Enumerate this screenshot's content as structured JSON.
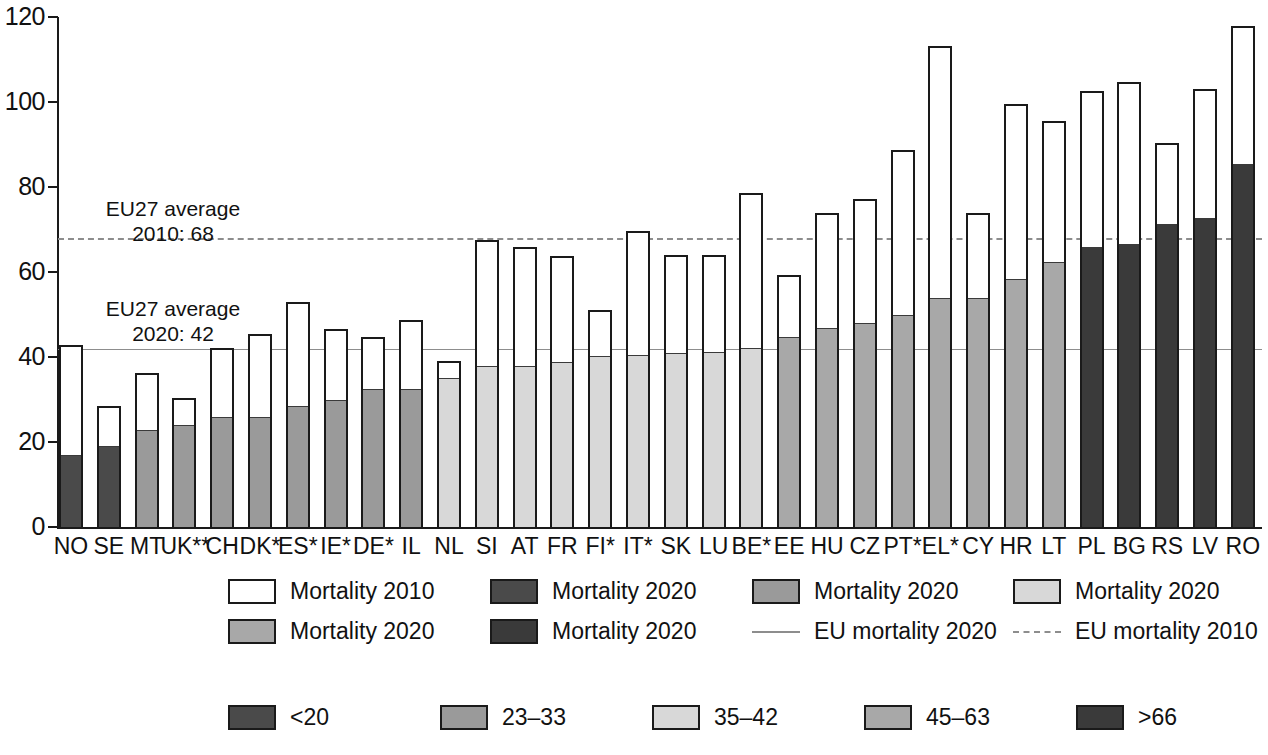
{
  "chart_data": {
    "type": "bar",
    "title": "",
    "subtitle": "",
    "xlabel": "",
    "ylabel": "",
    "ylim": [
      0,
      120
    ],
    "yticks": [
      0,
      20,
      40,
      60,
      80,
      100,
      120
    ],
    "grid": false,
    "legend_position": "bottom",
    "categories": [
      "NO",
      "SE",
      "MT",
      "UK**",
      "CH",
      "DK*",
      "ES*",
      "IE*",
      "DE*",
      "IL",
      "NL",
      "SI",
      "AT",
      "FR",
      "FI*",
      "IT*",
      "SK",
      "LU",
      "BE*",
      "EE",
      "HU",
      "CZ",
      "PT*",
      "EL*",
      "CY",
      "HR",
      "LT",
      "PL",
      "BG",
      "RS",
      "LV",
      "RO"
    ],
    "series": [
      {
        "name": "Mortality 2010",
        "values": [
          42.8,
          28.4,
          36.2,
          30.4,
          42.1,
          45.5,
          52.9,
          46.5,
          44.6,
          48.6,
          39.0,
          67.5,
          66.0,
          63.7,
          51.0,
          69.6,
          64.0,
          63.9,
          78.6,
          59.4,
          74.0,
          77.1,
          88.6,
          113.2,
          74.0,
          99.6,
          95.5,
          102.6,
          104.6,
          90.4,
          103.0,
          118.0
        ]
      },
      {
        "name": "Mortality 2020",
        "values": [
          17.0,
          19.1,
          22.8,
          24.1,
          25.9,
          26.0,
          28.4,
          30.0,
          32.5,
          32.4,
          35.0,
          37.8,
          38.0,
          38.9,
          40.2,
          40.4,
          41.0,
          41.1,
          42.2,
          44.8,
          46.9,
          47.9,
          49.9,
          53.9,
          53.9,
          58.4,
          62.3,
          65.8,
          66.6,
          71.2,
          72.8,
          85.4
        ]
      }
    ],
    "bands": [
      "<20",
      "23-33",
      "35-42",
      "45-63",
      ">66"
    ],
    "band_index": [
      0,
      0,
      1,
      1,
      1,
      1,
      1,
      1,
      1,
      1,
      2,
      2,
      2,
      2,
      2,
      2,
      2,
      2,
      2,
      3,
      3,
      3,
      3,
      3,
      3,
      3,
      3,
      4,
      4,
      4,
      4,
      4
    ],
    "reference_lines": [
      {
        "name": "EU mortality 2010",
        "value": 68,
        "style": "dashed",
        "label": "EU27 average\n2010: 68"
      },
      {
        "name": "EU mortality 2020",
        "value": 42,
        "style": "solid",
        "label": "EU27 average\n2020: 42"
      }
    ]
  },
  "axis": {
    "y_tick_labels": [
      "120",
      "100",
      "80",
      "60",
      "40",
      "20",
      "0"
    ]
  },
  "annotations": {
    "eu_2010": "EU27 average\n2010: 68",
    "eu_2020": "EU27 average\n2020: 42"
  },
  "legend": {
    "row1": [
      {
        "label": "Mortality 2010",
        "type": "swatch",
        "color": "#ffffff"
      },
      {
        "label": "Mortality 2020",
        "type": "swatch",
        "color": "#4a4a4a"
      },
      {
        "label": "Mortality 2020",
        "type": "swatch",
        "color": "#9a9a9a"
      },
      {
        "label": "Mortality 2020",
        "type": "swatch",
        "color": "#d8d8d8"
      }
    ],
    "row2": [
      {
        "label": "Mortality 2020",
        "type": "swatch",
        "color": "#a8a8a8"
      },
      {
        "label": "Mortality 2020",
        "type": "swatch",
        "color": "#3a3a3a"
      },
      {
        "label": "EU mortality 2020",
        "type": "line",
        "color": "#8d8d8d"
      },
      {
        "label": "EU mortality 2010",
        "type": "dashed-line",
        "color": "#8d8d8d"
      }
    ]
  },
  "scale_legend": [
    {
      "label": "<20",
      "color": "#4a4a4a"
    },
    {
      "label": "23–33",
      "color": "#9a9a9a"
    },
    {
      "label": "35–42",
      "color": "#d8d8d8"
    },
    {
      "label": "45–63",
      "color": "#a8a8a8"
    },
    {
      "label": ">66",
      "color": "#3a3a3a"
    }
  ],
  "colors": {
    "band0": "#4a4a4a",
    "band1": "#9a9a9a",
    "band2": "#d8d8d8",
    "band3": "#a8a8a8",
    "band4": "#3a3a3a",
    "outline": "#1a1a1a",
    "reference": "#8d8d8d",
    "mortality_2010_fill": "#ffffff"
  }
}
